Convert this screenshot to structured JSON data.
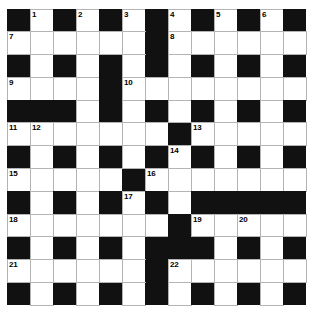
{
  "puzzle": {
    "title": "Crossword Grid",
    "rows": 13,
    "cols": 13,
    "cell_size": 23,
    "colors": {
      "block": "#111111",
      "cell": "#ffffff",
      "grid_line": "#b4b4b4",
      "number": "#000000",
      "background": "#ffffff"
    },
    "grid": [
      [
        "#",
        ".",
        "#",
        ".",
        "#",
        ".",
        "#",
        ".",
        "#",
        ".",
        "#",
        ".",
        "#"
      ],
      [
        ".",
        ".",
        ".",
        ".",
        ".",
        ".",
        "#",
        ".",
        ".",
        ".",
        ".",
        ".",
        "."
      ],
      [
        "#",
        ".",
        "#",
        ".",
        "#",
        ".",
        "#",
        ".",
        "#",
        ".",
        "#",
        ".",
        "#"
      ],
      [
        ".",
        ".",
        ".",
        ".",
        "#",
        ".",
        ".",
        ".",
        ".",
        ".",
        ".",
        ".",
        "."
      ],
      [
        "#",
        "#",
        "#",
        ".",
        "#",
        ".",
        "#",
        ".",
        "#",
        ".",
        "#",
        ".",
        "#"
      ],
      [
        ".",
        ".",
        ".",
        ".",
        ".",
        ".",
        ".",
        "#",
        ".",
        ".",
        ".",
        ".",
        "."
      ],
      [
        "#",
        ".",
        "#",
        ".",
        "#",
        ".",
        "#",
        ".",
        "#",
        ".",
        "#",
        ".",
        "#"
      ],
      [
        ".",
        ".",
        ".",
        ".",
        ".",
        "#",
        ".",
        ".",
        ".",
        ".",
        ".",
        ".",
        "."
      ],
      [
        "#",
        ".",
        "#",
        ".",
        "#",
        ".",
        "#",
        ".",
        "#",
        "#",
        "#",
        "#",
        "#"
      ],
      [
        ".",
        ".",
        ".",
        ".",
        ".",
        ".",
        ".",
        "#",
        ".",
        ".",
        ".",
        ".",
        "."
      ],
      [
        "#",
        ".",
        "#",
        ".",
        "#",
        ".",
        "#",
        "#",
        "#",
        ".",
        "#",
        ".",
        "#"
      ],
      [
        ".",
        ".",
        ".",
        ".",
        ".",
        ".",
        "#",
        ".",
        ".",
        ".",
        ".",
        ".",
        "."
      ],
      [
        "#",
        ".",
        "#",
        ".",
        "#",
        ".",
        "#",
        ".",
        "#",
        ".",
        "#",
        ".",
        "#"
      ]
    ],
    "numbers": [
      {
        "row": 0,
        "col": 1,
        "label": "1"
      },
      {
        "row": 0,
        "col": 3,
        "label": "2"
      },
      {
        "row": 0,
        "col": 5,
        "label": "3"
      },
      {
        "row": 0,
        "col": 7,
        "label": "4"
      },
      {
        "row": 0,
        "col": 9,
        "label": "5"
      },
      {
        "row": 0,
        "col": 11,
        "label": "6"
      },
      {
        "row": 1,
        "col": 0,
        "label": "7"
      },
      {
        "row": 1,
        "col": 7,
        "label": "8"
      },
      {
        "row": 3,
        "col": 0,
        "label": "9"
      },
      {
        "row": 3,
        "col": 5,
        "label": "10"
      },
      {
        "row": 5,
        "col": 0,
        "label": "11"
      },
      {
        "row": 5,
        "col": 1,
        "label": "12"
      },
      {
        "row": 5,
        "col": 8,
        "label": "13"
      },
      {
        "row": 6,
        "col": 7,
        "label": "14"
      },
      {
        "row": 7,
        "col": 0,
        "label": "15"
      },
      {
        "row": 7,
        "col": 6,
        "label": "16"
      },
      {
        "row": 8,
        "col": 5,
        "label": "17"
      },
      {
        "row": 9,
        "col": 0,
        "label": "18"
      },
      {
        "row": 9,
        "col": 8,
        "label": "19"
      },
      {
        "row": 9,
        "col": 10,
        "label": "20"
      },
      {
        "row": 11,
        "col": 0,
        "label": "21"
      },
      {
        "row": 11,
        "col": 7,
        "label": "22"
      }
    ],
    "letters": []
  }
}
